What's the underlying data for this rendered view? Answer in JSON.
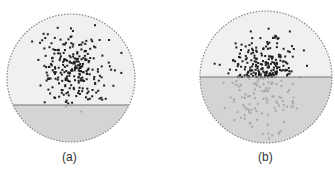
{
  "colors": {
    "background": "#ffffff",
    "upper_fill": "#f0f0f0",
    "lower_fill": "#d4d4d4",
    "border": "#888888",
    "interface_line": "#777777",
    "dot_dark": "#1e1e1e",
    "dot_light": "#a9a9a9"
  },
  "panels": [
    {
      "id": "a",
      "caption": "(a)",
      "circle": {
        "cx": 71,
        "cy": 78,
        "r": 64
      },
      "interface_y": 105,
      "caption_pos": {
        "x": 62,
        "y": 150
      },
      "cloud": {
        "cx": 72,
        "cy": 67,
        "sx": 16,
        "sy": 19,
        "n": 260,
        "seed": 7
      }
    },
    {
      "id": "b",
      "caption": "(b)",
      "circle": {
        "cx": 266,
        "cy": 77,
        "r": 66
      },
      "interface_y": 77,
      "caption_pos": {
        "x": 258,
        "y": 150
      },
      "cloud": {
        "cx": 264,
        "cy": 72,
        "sx": 17,
        "sy": 17,
        "n": 330,
        "seed": 13
      }
    }
  ]
}
